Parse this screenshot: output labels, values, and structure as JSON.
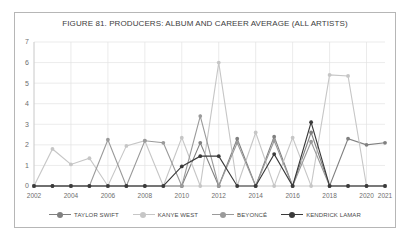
{
  "chart_data": {
    "type": "line",
    "title": "FIGURE 81. PRODUCERS: ALBUM AND CAREER AVERAGE (ALL ARTISTS)",
    "xlabel": "",
    "ylabel": "",
    "ylim": [
      0,
      7
    ],
    "xlim": [
      2002,
      2021
    ],
    "grid": true,
    "legend_position": "bottom",
    "yticks": [
      "0",
      "1",
      "2",
      "3",
      "4",
      "5",
      "6",
      "7"
    ],
    "xticks": [
      "2002",
      "2004",
      "2006",
      "2008",
      "2010",
      "2012",
      "2014",
      "2016",
      "2018",
      "2020",
      "2021"
    ],
    "x": [
      2002,
      2003,
      2004,
      2005,
      2006,
      2007,
      2008,
      2009,
      2010,
      2011,
      2012,
      2013,
      2014,
      2015,
      2016,
      2017,
      2018,
      2019,
      2020,
      2021
    ],
    "series": [
      {
        "name": "TAYLOR SWIFT",
        "color": "#808080",
        "values": [
          0,
          0,
          0,
          0,
          0,
          0,
          0,
          0,
          0,
          2.1,
          0,
          2.3,
          0,
          2.4,
          0,
          2.6,
          0,
          2.3,
          2.0,
          2.1
        ]
      },
      {
        "name": "KANYE WEST",
        "color": "#c6c6c6",
        "values": [
          0,
          1.8,
          1.05,
          1.35,
          0,
          1.95,
          2.2,
          0,
          2.35,
          0,
          6.0,
          0,
          2.6,
          0,
          2.35,
          0,
          5.4,
          5.35,
          0,
          0
        ]
      },
      {
        "name": "BEYONCÉ",
        "color": "#9a9a9a",
        "values": [
          0,
          0,
          0,
          0,
          2.25,
          0,
          2.2,
          2.1,
          0,
          3.4,
          0,
          2.1,
          0,
          2.2,
          0,
          2.15,
          0,
          0,
          0,
          0
        ]
      },
      {
        "name": "KENDRICK LAMAR",
        "color": "#3a3a3a",
        "values": [
          0,
          0,
          0,
          0,
          0,
          0,
          0,
          0,
          0.95,
          1.45,
          1.45,
          0,
          0,
          1.55,
          0,
          3.1,
          0,
          0,
          0,
          0
        ]
      }
    ]
  },
  "legend": {
    "items": [
      {
        "label": "TAYLOR SWIFT",
        "color": "#808080"
      },
      {
        "label": "KANYE WEST",
        "color": "#c6c6c6"
      },
      {
        "label": "BEYONCÉ",
        "color": "#9a9a9a"
      },
      {
        "label": "KENDRICK LAMAR",
        "color": "#3a3a3a"
      }
    ]
  }
}
